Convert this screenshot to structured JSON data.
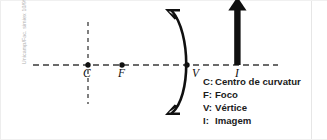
{
  "credit": {
    "text": "Unicamp/Fac. simiex 10/99"
  },
  "figure": {
    "axis_label": "optical-axis",
    "points": [
      {
        "id": "C",
        "label": "C",
        "x": 88,
        "y": 65
      },
      {
        "id": "F",
        "label": "F",
        "x": 122,
        "y": 65
      },
      {
        "id": "V",
        "label": "V",
        "x": 186,
        "y": 65
      }
    ],
    "image_arrow": {
      "id": "I",
      "label": "I",
      "x": 238,
      "base_y": 65,
      "tip_y": 2
    },
    "mirror": {
      "type": "concave-arc",
      "vertex_x": 186,
      "top_y": 10,
      "bottom_y": 114
    },
    "principal_axis": {
      "x_start": 33,
      "x_end": 278,
      "y": 65,
      "style": "dashed"
    },
    "vertical_dashed": {
      "x": 88,
      "y_start": 22,
      "y_end": 104,
      "style": "dashed"
    },
    "colors": {
      "ink": "#111111",
      "dash": "#3a3a3a",
      "watermark": "#b2b2b2"
    }
  },
  "legend": {
    "items": [
      {
        "key": "C:",
        "text": "Centro de curvatur"
      },
      {
        "key": "F:",
        "text": "Foco"
      },
      {
        "key": "V:",
        "text": "Vértice"
      },
      {
        "key": "I:",
        "text": "Imagem"
      }
    ]
  }
}
